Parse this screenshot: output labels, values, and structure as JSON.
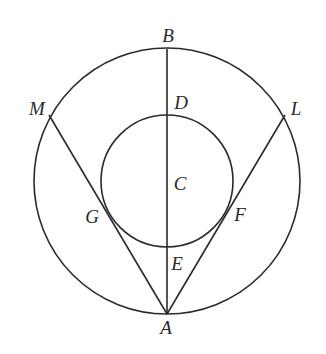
{
  "figure": {
    "type": "geometry-diagram",
    "stroke_color": "#2a2a2a",
    "background": "#ffffff",
    "outer_circle": {
      "cx": 167,
      "cy": 181,
      "r": 133
    },
    "inner_circle": {
      "cx": 167,
      "cy": 181,
      "r": 66,
      "center_label": "C"
    },
    "segments": [
      {
        "from": "B",
        "to": "A"
      },
      {
        "from": "M",
        "to": "A"
      },
      {
        "from": "L",
        "to": "A"
      }
    ],
    "points": {
      "A": {
        "x": 167,
        "y": 314
      },
      "B": {
        "x": 167,
        "y": 49
      },
      "C": {
        "x": 167,
        "y": 181
      },
      "D": {
        "x": 167,
        "y": 116
      },
      "E": {
        "x": 167,
        "y": 247
      },
      "F": {
        "x": 224,
        "y": 216
      },
      "G": {
        "x": 110,
        "y": 216
      },
      "L": {
        "x": 285,
        "y": 115
      },
      "M": {
        "x": 49,
        "y": 115
      }
    },
    "labels": [
      {
        "id": "B",
        "text": "B",
        "x": 168,
        "y": 35
      },
      {
        "id": "D",
        "text": "D",
        "x": 181,
        "y": 102
      },
      {
        "id": "M",
        "text": "M",
        "x": 37,
        "y": 108
      },
      {
        "id": "L",
        "text": "L",
        "x": 296,
        "y": 108
      },
      {
        "id": "C",
        "text": "C",
        "x": 180,
        "y": 183
      },
      {
        "id": "G",
        "text": "G",
        "x": 92,
        "y": 216
      },
      {
        "id": "F",
        "text": "F",
        "x": 240,
        "y": 214
      },
      {
        "id": "E",
        "text": "E",
        "x": 177,
        "y": 263
      },
      {
        "id": "A",
        "text": "A",
        "x": 166,
        "y": 327
      }
    ]
  }
}
